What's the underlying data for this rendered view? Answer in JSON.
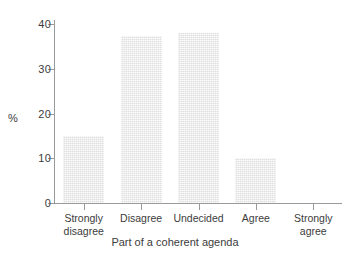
{
  "chart_data": {
    "type": "bar",
    "title": "",
    "subtitle": "",
    "xlabel": "Part of a coherent agenda",
    "ylabel": "%",
    "categories": [
      "Strongly\ndisagree",
      "Disagree",
      "Undecided",
      "Agree",
      "Strongly\nagree"
    ],
    "values": [
      15,
      37.5,
      38,
      10,
      0
    ],
    "ylim": [
      0,
      41
    ],
    "yticks": [
      0,
      10,
      20,
      30,
      40
    ],
    "ytick_labels": [
      "0",
      "10",
      "20",
      "30",
      "40"
    ],
    "grid": false,
    "legend": null,
    "bar_color": "#e9e9e9",
    "axis_color": "#9a9a9a",
    "text_color": "#3c3c3c",
    "background": "#ffffff"
  },
  "axes": {
    "y_title": "%",
    "x_title": "Part of a coherent agenda"
  }
}
